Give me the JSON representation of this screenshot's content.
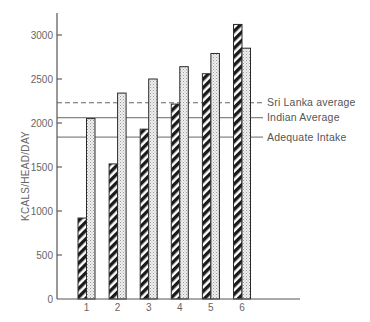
{
  "chart_data": {
    "type": "bar",
    "title": "",
    "xlabel": "",
    "ylabel": "KCALS/HEAD/DAY",
    "ylim": [
      0,
      3300
    ],
    "yticks": [
      0,
      500,
      1000,
      1500,
      2000,
      2500,
      3000
    ],
    "grid": false,
    "legend_position": "none",
    "categories": [
      "1",
      "2",
      "3",
      "4",
      "5",
      "6"
    ],
    "series": [
      {
        "name": "Series A (hatched)",
        "pattern": "diagonal-hatch",
        "values": [
          920,
          1535,
          1930,
          2215,
          2560,
          3120
        ]
      },
      {
        "name": "Series B (dotted)",
        "pattern": "stipple",
        "values": [
          2050,
          2340,
          2500,
          2640,
          2790,
          2850
        ]
      }
    ],
    "reference_lines": [
      {
        "label": "Sri Lanka average",
        "value": 2230,
        "style": "dashed"
      },
      {
        "label": "Indian Average",
        "value": 2060,
        "style": "solid"
      },
      {
        "label": "Adequate Intake",
        "value": 1840,
        "style": "solid"
      }
    ]
  },
  "colors": {
    "axis": "#555555",
    "hatch_dark": "#1a1a1a",
    "stipple_bg": "#eeeeee",
    "stipple_dot": "#9a9a9a"
  }
}
